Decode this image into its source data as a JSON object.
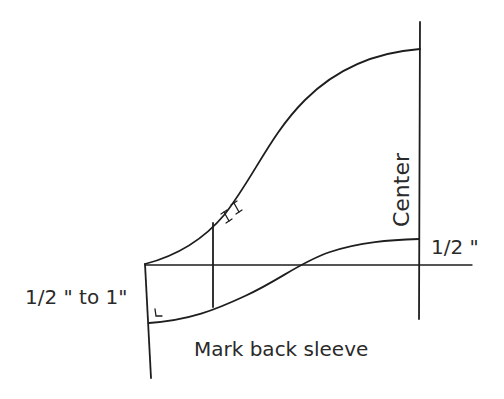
{
  "diagram": {
    "type": "sewing-pattern-sleeve-draft",
    "stroke_color": "#1e1e1e",
    "labels": {
      "center": "Center",
      "half_inch": "1/2 \"",
      "half_to_one_inch": "1/2 \" to 1\"",
      "caption": "Mark back sleeve"
    },
    "elements": [
      {
        "name": "sleeve-cap-curve",
        "description": "Upper S-curve from underarm corner to center line"
      },
      {
        "name": "hem-curve",
        "description": "Lower curve from left edge rising to center line 1/2 inch above horizontal"
      },
      {
        "name": "center-line",
        "description": "Vertical center line"
      },
      {
        "name": "horizontal-guide-line",
        "description": "Horizontal guide line"
      },
      {
        "name": "left-edge-line",
        "description": "Slanted left edge line"
      },
      {
        "name": "back-sleeve-marker-line",
        "description": "Vertical line marking back sleeve"
      },
      {
        "name": "double-notch",
        "description": "Double notch marks on sleeve cap (back)"
      },
      {
        "name": "right-angle-mark",
        "description": "Right angle symbol at lower left corner"
      }
    ]
  }
}
